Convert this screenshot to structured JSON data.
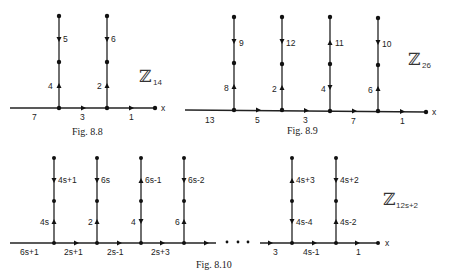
{
  "figures": [
    {
      "id": "fig-8-8",
      "caption": "Fig. 8.8",
      "group_label": "ℤ",
      "group_subscript": "14",
      "axis_label": "x",
      "horizontal_labels": [
        "7",
        "3",
        "1"
      ],
      "columns": [
        {
          "upper_label": "5",
          "upper_dir": "down",
          "lower_label": "4",
          "lower_dir": "up"
        },
        {
          "upper_label": "6",
          "upper_dir": "down",
          "lower_label": "2",
          "lower_dir": "up"
        }
      ]
    },
    {
      "id": "fig-8-9",
      "caption": "Fig. 8.9",
      "group_label": "ℤ",
      "group_subscript": "26",
      "axis_label": "x",
      "horizontal_labels": [
        "13",
        "5",
        "3",
        "7",
        "1"
      ],
      "columns": [
        {
          "upper_label": "9",
          "upper_dir": "down",
          "lower_label": "8",
          "lower_dir": "up"
        },
        {
          "upper_label": "12",
          "upper_dir": "down",
          "lower_label": "2",
          "lower_dir": "up"
        },
        {
          "upper_label": "11",
          "upper_dir": "up",
          "lower_label": "4",
          "lower_dir": "down"
        },
        {
          "upper_label": "10",
          "upper_dir": "down",
          "lower_label": "6",
          "lower_dir": "up"
        }
      ]
    },
    {
      "id": "fig-8-10",
      "caption": "Fig. 8.10",
      "group_label": "ℤ",
      "group_subscript": "12s+2",
      "axis_label": "x",
      "ellipsis": "• • •",
      "horizontal_labels": [
        "6s+1",
        "2s+1",
        "2s-1",
        "2s+3",
        "3",
        "4s-1",
        "1"
      ],
      "columns": [
        {
          "upper_label": "4s+1",
          "upper_dir": "down",
          "lower_label": "4s",
          "lower_dir": "up"
        },
        {
          "upper_label": "6s",
          "upper_dir": "down",
          "lower_label": "2",
          "lower_dir": "up"
        },
        {
          "upper_label": "6s-1",
          "upper_dir": "up",
          "lower_label": "4",
          "lower_dir": "down"
        },
        {
          "upper_label": "6s-2",
          "upper_dir": "down",
          "lower_label": "6",
          "lower_dir": "up"
        },
        {
          "upper_label": "4s+3",
          "upper_dir": "up",
          "lower_label": "4s-4",
          "lower_dir": "down"
        },
        {
          "upper_label": "4s+2",
          "upper_dir": "down",
          "lower_label": "4s-2",
          "lower_dir": "up"
        }
      ]
    }
  ]
}
